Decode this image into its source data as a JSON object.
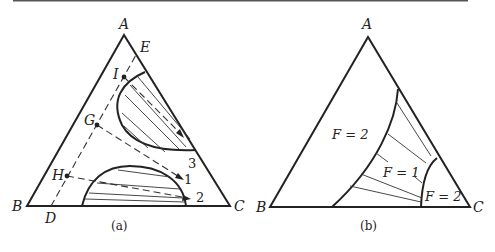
{
  "figure": {
    "top_rule_color": "#555555",
    "panel_a": {
      "caption": "(a)",
      "vertices": {
        "top": "A",
        "bottom_left": "B",
        "bottom_right": "C"
      },
      "edge_points": {
        "ab_point": "D",
        "ac_point": "E"
      },
      "mixture_points": [
        "I",
        "G",
        "H"
      ],
      "arrow_targets": [
        "3",
        "1",
        "2"
      ]
    },
    "panel_b": {
      "caption": "(b)",
      "vertices": {
        "top": "A",
        "bottom_left": "B",
        "bottom_right": "C"
      },
      "regions": {
        "left": "F = 2",
        "middle": "F = 1",
        "right": "F = 2"
      }
    }
  }
}
